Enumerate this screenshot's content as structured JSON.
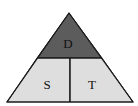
{
  "diagram": {
    "sections": [
      {
        "key": "top",
        "label": "D",
        "fill": "#5c5c5c"
      },
      {
        "key": "bottom_left",
        "label": "S",
        "fill": "#dedede"
      },
      {
        "key": "bottom_right",
        "label": "T",
        "fill": "#dedede"
      }
    ],
    "stroke_color": "#1a1a1a"
  }
}
